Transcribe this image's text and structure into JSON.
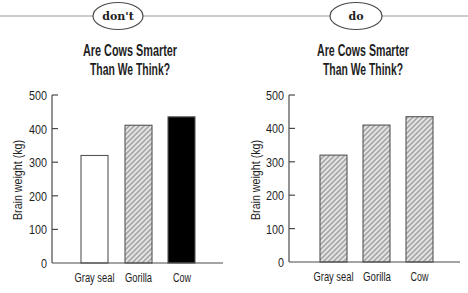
{
  "header": {
    "rule_color": "#9a9a9a"
  },
  "panels": [
    {
      "tag": "don't",
      "title_line1": "Are Cows Smarter",
      "title_line2": "Than We Think?",
      "ylabel": "Brain weight (kg)",
      "yticks": [
        "500",
        "400",
        "300",
        "200",
        "100",
        "0"
      ],
      "categories": [
        "Gray seal",
        "Gorilla",
        "Cow"
      ]
    },
    {
      "tag": "do",
      "title_line1": "Are Cows Smarter",
      "title_line2": "Than We Think?",
      "ylabel": "Brain weight (kg)",
      "yticks": [
        "500",
        "400",
        "300",
        "200",
        "100",
        "0"
      ],
      "categories": [
        "Gray seal",
        "Gorilla",
        "Cow"
      ]
    }
  ],
  "colors": {
    "text": "#1e1e1e",
    "axis": "#4a4a4a",
    "bar_outline": "#555555",
    "hatch_background": "#e6e6e6",
    "hatch_stripe": "#a8a8a8",
    "bar_white": "#ffffff",
    "bar_black": "#000000"
  },
  "chart_data": [
    {
      "type": "bar",
      "variant_label": "don't",
      "title": "Are Cows Smarter Than We Think?",
      "categories": [
        "Gray seal",
        "Gorilla",
        "Cow"
      ],
      "values": [
        320,
        410,
        435
      ],
      "bar_fills": [
        "white",
        "hatch",
        "black"
      ],
      "xlabel": "",
      "ylabel": "Brain weight (kg)",
      "ylim": [
        0,
        500
      ],
      "yticks": [
        0,
        100,
        200,
        300,
        400,
        500
      ],
      "grid": false,
      "legend": null
    },
    {
      "type": "bar",
      "variant_label": "do",
      "title": "Are Cows Smarter Than We Think?",
      "categories": [
        "Gray seal",
        "Gorilla",
        "Cow"
      ],
      "values": [
        320,
        410,
        435
      ],
      "bar_fills": [
        "hatch",
        "hatch",
        "hatch"
      ],
      "xlabel": "",
      "ylabel": "Brain weight (kg)",
      "ylim": [
        0,
        500
      ],
      "yticks": [
        0,
        100,
        200,
        300,
        400,
        500
      ],
      "grid": false,
      "legend": null
    }
  ]
}
